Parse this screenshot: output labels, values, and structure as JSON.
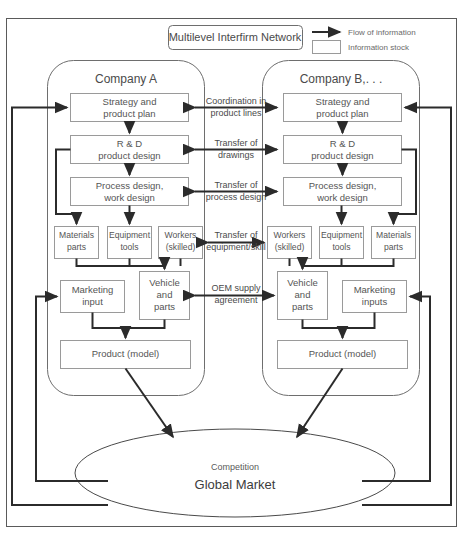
{
  "title_box": {
    "label": "Multilevel Interfirm Network"
  },
  "legend": {
    "items": [
      {
        "icon": "arrow-icon",
        "label": "Flow of information"
      },
      {
        "icon": "rectangle-icon",
        "label": "Information stock"
      }
    ]
  },
  "companies": [
    {
      "id": "company-a",
      "name": "Company A",
      "boxes": [
        {
          "id": "strategy-a",
          "lines": [
            "Strategy and",
            "product plan"
          ]
        },
        {
          "id": "rnd-a",
          "lines": [
            "R & D",
            "product design"
          ]
        },
        {
          "id": "process-a",
          "lines": [
            "Process design,",
            "work design"
          ]
        },
        {
          "id": "materials-a",
          "lines": [
            "Materials",
            "parts"
          ]
        },
        {
          "id": "equipment-a",
          "lines": [
            "Equipment",
            "tools"
          ]
        },
        {
          "id": "workers-a",
          "lines": [
            "Workers",
            "(skilled)"
          ]
        },
        {
          "id": "marketing-a",
          "lines": [
            "Marketing",
            "input"
          ]
        },
        {
          "id": "vehicle-a",
          "lines": [
            "Vehicle",
            "and",
            "parts"
          ]
        },
        {
          "id": "product-a",
          "lines": [
            "Product (model)"
          ]
        }
      ]
    },
    {
      "id": "company-b",
      "name": "Company B,. . .",
      "boxes": [
        {
          "id": "strategy-b",
          "lines": [
            "Strategy and",
            "product plan"
          ]
        },
        {
          "id": "rnd-b",
          "lines": [
            "R & D",
            "product design"
          ]
        },
        {
          "id": "process-b",
          "lines": [
            "Process design,",
            "work design"
          ]
        },
        {
          "id": "workers-b",
          "lines": [
            "Workers",
            "(skilled)"
          ]
        },
        {
          "id": "equipment-b",
          "lines": [
            "Equipment",
            "tools"
          ]
        },
        {
          "id": "materials-b",
          "lines": [
            "Materials",
            "parts"
          ]
        },
        {
          "id": "vehicle-b",
          "lines": [
            "Vehicle",
            "and",
            "parts"
          ]
        },
        {
          "id": "marketing-b",
          "lines": [
            "Marketing",
            "inputs"
          ]
        },
        {
          "id": "product-b",
          "lines": [
            "Product (model)"
          ]
        }
      ]
    }
  ],
  "interfirm_links": [
    {
      "id": "link-coordination",
      "lines": [
        "Coordination in",
        "product lines"
      ]
    },
    {
      "id": "link-drawings",
      "lines": [
        "Transfer of",
        "drawings"
      ]
    },
    {
      "id": "link-process",
      "lines": [
        "Transfer of",
        "process design"
      ]
    },
    {
      "id": "link-equipment",
      "lines": [
        "Transfer of",
        "equipment/skill"
      ]
    },
    {
      "id": "link-oem",
      "lines": [
        "OEM supply",
        "agreement"
      ]
    }
  ],
  "market": {
    "line1": "Competition",
    "line2": "Global Market"
  },
  "colors": {
    "stroke_dark": "#2b2b2b",
    "stroke_box": "#9a9a9a",
    "stroke_shell": "#6e6e6e",
    "text": "#4a4a4a",
    "background": "#ffffff"
  }
}
